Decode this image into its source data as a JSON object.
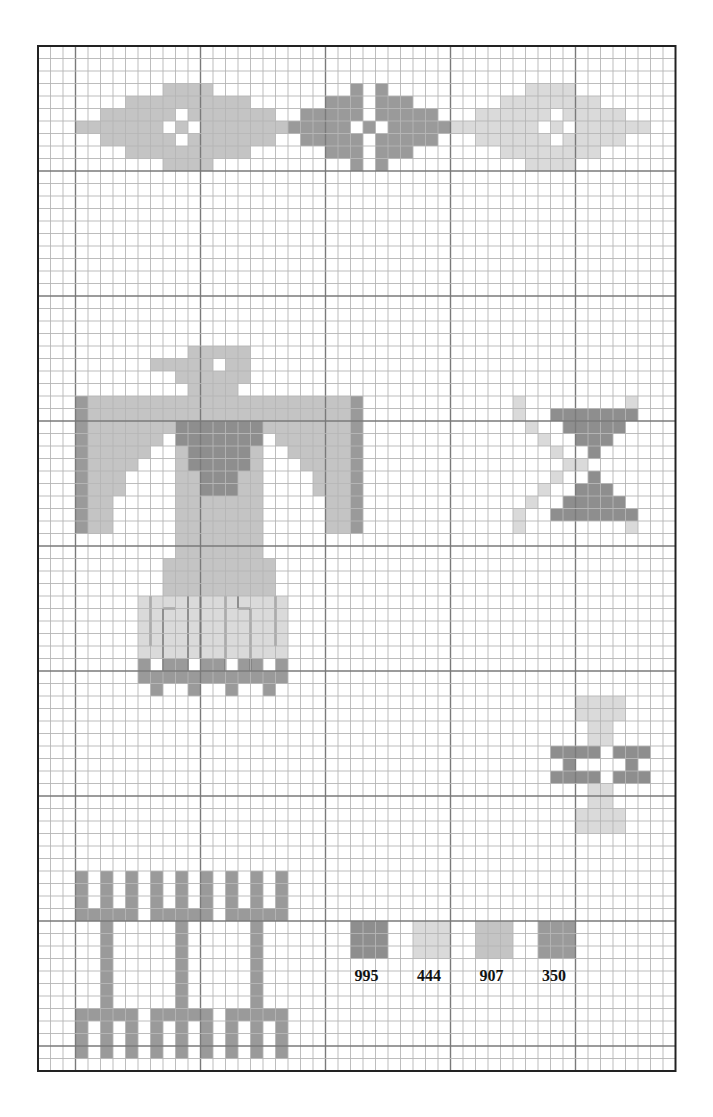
{
  "chart": {
    "grid": {
      "x0": 38,
      "y0": 46,
      "cell": 12.5,
      "cols": 51,
      "rows": 82,
      "major_every": 10,
      "major_col_offset": 3,
      "major_row_offset": 0
    },
    "colors": {
      "995": "#8e8e8e",
      "444": "#dadada",
      "907": "#c4c4c4",
      "350": "#9a9a9a",
      "grid_minor": "#b5b5b5",
      "grid_major": "#7a7a7a",
      "border": "#222222"
    }
  },
  "legend": {
    "items": [
      {
        "code": "995",
        "label": "995",
        "col": 25,
        "row": 70
      },
      {
        "code": "444",
        "label": "444",
        "col": 30,
        "row": 70
      },
      {
        "code": "907",
        "label": "907",
        "col": 35,
        "row": 70
      },
      {
        "code": "350",
        "label": "350",
        "col": 40,
        "row": 70
      }
    ]
  },
  "motifs": [
    {
      "name": "top-left-diamond",
      "color": "907",
      "rows": [
        [
          3,
          10,
          13
        ],
        [
          4,
          7,
          16
        ],
        [
          5,
          5,
          10
        ],
        [
          5,
          12,
          18
        ],
        [
          6,
          3,
          9
        ],
        [
          6,
          11,
          11
        ],
        [
          6,
          13,
          21
        ],
        [
          7,
          5,
          10
        ],
        [
          7,
          12,
          18
        ],
        [
          8,
          7,
          16
        ],
        [
          9,
          10,
          13
        ]
      ]
    },
    {
      "name": "top-middle-diamond",
      "color": "350",
      "rows": [
        [
          3,
          25,
          25
        ],
        [
          3,
          27,
          27
        ],
        [
          4,
          23,
          25
        ],
        [
          4,
          27,
          29
        ],
        [
          5,
          21,
          25
        ],
        [
          5,
          27,
          31
        ],
        [
          6,
          20,
          24
        ],
        [
          6,
          26,
          26
        ],
        [
          6,
          28,
          33
        ],
        [
          7,
          21,
          25
        ],
        [
          7,
          27,
          31
        ],
        [
          8,
          23,
          25
        ],
        [
          8,
          27,
          29
        ],
        [
          9,
          25,
          25
        ],
        [
          9,
          27,
          27
        ]
      ]
    },
    {
      "name": "top-right-diamond",
      "color": "444",
      "rows": [
        [
          3,
          39,
          42
        ],
        [
          4,
          37,
          44
        ],
        [
          5,
          35,
          40
        ],
        [
          5,
          42,
          46
        ],
        [
          6,
          33,
          39
        ],
        [
          6,
          41,
          41
        ],
        [
          6,
          43,
          48
        ],
        [
          7,
          35,
          40
        ],
        [
          7,
          42,
          46
        ],
        [
          8,
          37,
          44
        ],
        [
          9,
          39,
          42
        ]
      ]
    },
    {
      "name": "thunderbird-head",
      "color": "907",
      "rows": [
        [
          24,
          12,
          16
        ],
        [
          25,
          9,
          13
        ],
        [
          25,
          15,
          16
        ],
        [
          26,
          11,
          16
        ],
        [
          27,
          12,
          15
        ]
      ]
    },
    {
      "name": "thunderbird-wings",
      "color": "907",
      "rows": [
        [
          28,
          4,
          24
        ],
        [
          29,
          4,
          24
        ],
        [
          30,
          4,
          10
        ],
        [
          30,
          18,
          24
        ],
        [
          31,
          4,
          9
        ],
        [
          31,
          19,
          24
        ],
        [
          32,
          4,
          8
        ],
        [
          32,
          20,
          24
        ],
        [
          33,
          4,
          7
        ],
        [
          33,
          21,
          24
        ],
        [
          34,
          4,
          6
        ],
        [
          34,
          22,
          24
        ],
        [
          35,
          4,
          6
        ],
        [
          35,
          22,
          24
        ],
        [
          36,
          4,
          5
        ],
        [
          36,
          23,
          24
        ],
        [
          37,
          4,
          5
        ],
        [
          37,
          23,
          24
        ],
        [
          38,
          4,
          5
        ],
        [
          38,
          23,
          24
        ]
      ]
    },
    {
      "name": "thunderbird-wing-edges",
      "color": "350",
      "rows": [
        [
          28,
          3,
          3
        ],
        [
          29,
          3,
          3
        ],
        [
          30,
          3,
          3
        ],
        [
          31,
          3,
          3
        ],
        [
          32,
          3,
          3
        ],
        [
          33,
          3,
          3
        ],
        [
          34,
          3,
          3
        ],
        [
          35,
          3,
          3
        ],
        [
          36,
          3,
          3
        ],
        [
          37,
          3,
          3
        ],
        [
          38,
          3,
          3
        ],
        [
          28,
          25,
          25
        ],
        [
          29,
          25,
          25
        ],
        [
          30,
          25,
          25
        ],
        [
          31,
          25,
          25
        ],
        [
          32,
          25,
          25
        ],
        [
          33,
          25,
          25
        ],
        [
          34,
          25,
          25
        ],
        [
          35,
          25,
          25
        ],
        [
          36,
          25,
          25
        ],
        [
          37,
          25,
          25
        ],
        [
          38,
          25,
          25
        ]
      ]
    },
    {
      "name": "thunderbird-chest",
      "color": "995",
      "rows": [
        [
          30,
          11,
          17
        ],
        [
          31,
          11,
          17
        ],
        [
          32,
          12,
          16
        ],
        [
          33,
          12,
          16
        ],
        [
          34,
          13,
          15
        ],
        [
          35,
          13,
          15
        ]
      ]
    },
    {
      "name": "thunderbird-body",
      "color": "907",
      "rows": [
        [
          32,
          11,
          11
        ],
        [
          32,
          17,
          17
        ],
        [
          33,
          11,
          11
        ],
        [
          33,
          17,
          17
        ],
        [
          34,
          11,
          12
        ],
        [
          34,
          16,
          17
        ],
        [
          35,
          11,
          12
        ],
        [
          35,
          16,
          17
        ],
        [
          36,
          11,
          17
        ],
        [
          37,
          11,
          17
        ],
        [
          38,
          11,
          17
        ],
        [
          39,
          11,
          17
        ],
        [
          40,
          11,
          17
        ],
        [
          41,
          10,
          18
        ],
        [
          42,
          10,
          18
        ],
        [
          43,
          10,
          18
        ]
      ]
    },
    {
      "name": "thunderbird-tail",
      "color": "444",
      "rows": [
        [
          44,
          8,
          19
        ],
        [
          45,
          8,
          19
        ],
        [
          46,
          8,
          19
        ],
        [
          47,
          8,
          19
        ],
        [
          48,
          8,
          19
        ]
      ]
    },
    {
      "name": "thunderbird-tail-fringe",
      "color": "350",
      "rows": [
        [
          49,
          8,
          8
        ],
        [
          49,
          10,
          11
        ],
        [
          49,
          13,
          14
        ],
        [
          49,
          16,
          17
        ],
        [
          49,
          19,
          19
        ],
        [
          50,
          8,
          19
        ],
        [
          51,
          9,
          9
        ],
        [
          51,
          12,
          12
        ],
        [
          51,
          15,
          15
        ],
        [
          51,
          18,
          18
        ]
      ]
    },
    {
      "name": "x-motif-arms",
      "color": "444",
      "rows": [
        [
          28,
          38,
          38
        ],
        [
          28,
          47,
          47
        ],
        [
          29,
          38,
          38
        ],
        [
          29,
          47,
          47
        ],
        [
          30,
          39,
          39
        ],
        [
          30,
          46,
          46
        ],
        [
          31,
          40,
          40
        ],
        [
          31,
          45,
          45
        ],
        [
          32,
          41,
          41
        ],
        [
          32,
          44,
          44
        ],
        [
          33,
          42,
          42
        ],
        [
          33,
          43,
          43
        ],
        [
          34,
          41,
          41
        ],
        [
          34,
          44,
          44
        ],
        [
          35,
          40,
          40
        ],
        [
          35,
          45,
          45
        ],
        [
          36,
          39,
          39
        ],
        [
          36,
          46,
          46
        ],
        [
          37,
          38,
          38
        ],
        [
          37,
          47,
          47
        ],
        [
          38,
          38,
          38
        ],
        [
          38,
          47,
          47
        ]
      ]
    },
    {
      "name": "x-motif-hourglass",
      "color": "995",
      "rows": [
        [
          29,
          41,
          47
        ],
        [
          30,
          42,
          46
        ],
        [
          31,
          43,
          45
        ],
        [
          32,
          44,
          44
        ],
        [
          34,
          44,
          44
        ],
        [
          35,
          43,
          45
        ],
        [
          36,
          42,
          46
        ],
        [
          37,
          41,
          47
        ]
      ]
    },
    {
      "name": "small-hourglass-top",
      "color": "444",
      "rows": [
        [
          52,
          43,
          46
        ],
        [
          53,
          43,
          46
        ],
        [
          54,
          44,
          45
        ],
        [
          55,
          44,
          45
        ]
      ]
    },
    {
      "name": "small-hourglass-bars",
      "color": "995",
      "rows": [
        [
          56,
          41,
          44
        ],
        [
          56,
          46,
          48
        ],
        [
          57,
          42,
          42
        ],
        [
          57,
          47,
          47
        ],
        [
          58,
          41,
          44
        ],
        [
          58,
          46,
          48
        ]
      ]
    },
    {
      "name": "small-hourglass-bottom",
      "color": "444",
      "rows": [
        [
          59,
          44,
          45
        ],
        [
          60,
          44,
          45
        ],
        [
          61,
          43,
          46
        ],
        [
          62,
          43,
          46
        ]
      ]
    },
    {
      "name": "tridents",
      "color": "350",
      "rows": [
        [
          66,
          3,
          3
        ],
        [
          66,
          5,
          5
        ],
        [
          66,
          7,
          7
        ],
        [
          66,
          9,
          9
        ],
        [
          66,
          11,
          11
        ],
        [
          66,
          13,
          13
        ],
        [
          66,
          15,
          15
        ],
        [
          66,
          17,
          17
        ],
        [
          66,
          19,
          19
        ],
        [
          67,
          3,
          3
        ],
        [
          67,
          5,
          5
        ],
        [
          67,
          7,
          7
        ],
        [
          67,
          9,
          9
        ],
        [
          67,
          11,
          11
        ],
        [
          67,
          13,
          13
        ],
        [
          67,
          15,
          15
        ],
        [
          67,
          17,
          17
        ],
        [
          67,
          19,
          19
        ],
        [
          68,
          3,
          3
        ],
        [
          68,
          5,
          5
        ],
        [
          68,
          7,
          7
        ],
        [
          68,
          9,
          9
        ],
        [
          68,
          11,
          11
        ],
        [
          68,
          13,
          13
        ],
        [
          68,
          15,
          15
        ],
        [
          68,
          17,
          17
        ],
        [
          68,
          19,
          19
        ],
        [
          69,
          3,
          7
        ],
        [
          69,
          9,
          13
        ],
        [
          69,
          15,
          19
        ],
        [
          70,
          5,
          5
        ],
        [
          70,
          11,
          11
        ],
        [
          70,
          17,
          17
        ],
        [
          71,
          5,
          5
        ],
        [
          71,
          11,
          11
        ],
        [
          71,
          17,
          17
        ],
        [
          72,
          5,
          5
        ],
        [
          72,
          11,
          11
        ],
        [
          72,
          17,
          17
        ],
        [
          73,
          5,
          5
        ],
        [
          73,
          11,
          11
        ],
        [
          73,
          17,
          17
        ],
        [
          74,
          5,
          5
        ],
        [
          74,
          11,
          11
        ],
        [
          74,
          17,
          17
        ],
        [
          75,
          5,
          5
        ],
        [
          75,
          11,
          11
        ],
        [
          75,
          17,
          17
        ],
        [
          76,
          5,
          5
        ],
        [
          76,
          11,
          11
        ],
        [
          76,
          17,
          17
        ],
        [
          77,
          3,
          7
        ],
        [
          77,
          9,
          13
        ],
        [
          77,
          15,
          19
        ],
        [
          78,
          3,
          3
        ],
        [
          78,
          5,
          5
        ],
        [
          78,
          7,
          7
        ],
        [
          78,
          9,
          9
        ],
        [
          78,
          11,
          11
        ],
        [
          78,
          13,
          13
        ],
        [
          78,
          15,
          15
        ],
        [
          78,
          17,
          17
        ],
        [
          78,
          19,
          19
        ],
        [
          79,
          3,
          3
        ],
        [
          79,
          5,
          5
        ],
        [
          79,
          7,
          7
        ],
        [
          79,
          9,
          9
        ],
        [
          79,
          11,
          11
        ],
        [
          79,
          13,
          13
        ],
        [
          79,
          15,
          15
        ],
        [
          79,
          17,
          17
        ],
        [
          79,
          19,
          19
        ],
        [
          80,
          3,
          3
        ],
        [
          80,
          5,
          5
        ],
        [
          80,
          7,
          7
        ],
        [
          80,
          9,
          9
        ],
        [
          80,
          11,
          11
        ],
        [
          80,
          13,
          13
        ],
        [
          80,
          15,
          15
        ],
        [
          80,
          17,
          17
        ],
        [
          80,
          19,
          19
        ]
      ]
    }
  ],
  "thunderbird_tail_lines": [
    {
      "x1c": 9,
      "y1r": 44,
      "x2c": 9,
      "y2r": 48
    },
    {
      "x1c": 10,
      "y1r": 45,
      "x2c": 11,
      "y2r": 45
    },
    {
      "x1c": 10,
      "y1r": 45,
      "x2c": 10,
      "y2r": 50
    },
    {
      "x1c": 12,
      "y1r": 44,
      "x2c": 12,
      "y2r": 50
    },
    {
      "x1c": 13,
      "y1r": 44,
      "x2c": 13,
      "y2r": 49
    },
    {
      "x1c": 15,
      "y1r": 44,
      "x2c": 15,
      "y2r": 50
    },
    {
      "x1c": 16,
      "y1r": 44,
      "x2c": 16,
      "y2r": 45
    },
    {
      "x1c": 16,
      "y1r": 45,
      "x2c": 17,
      "y2r": 45
    },
    {
      "x1c": 17,
      "y1r": 45,
      "x2c": 17,
      "y2r": 50
    },
    {
      "x1c": 19,
      "y1r": 44,
      "x2c": 19,
      "y2r": 48
    }
  ]
}
